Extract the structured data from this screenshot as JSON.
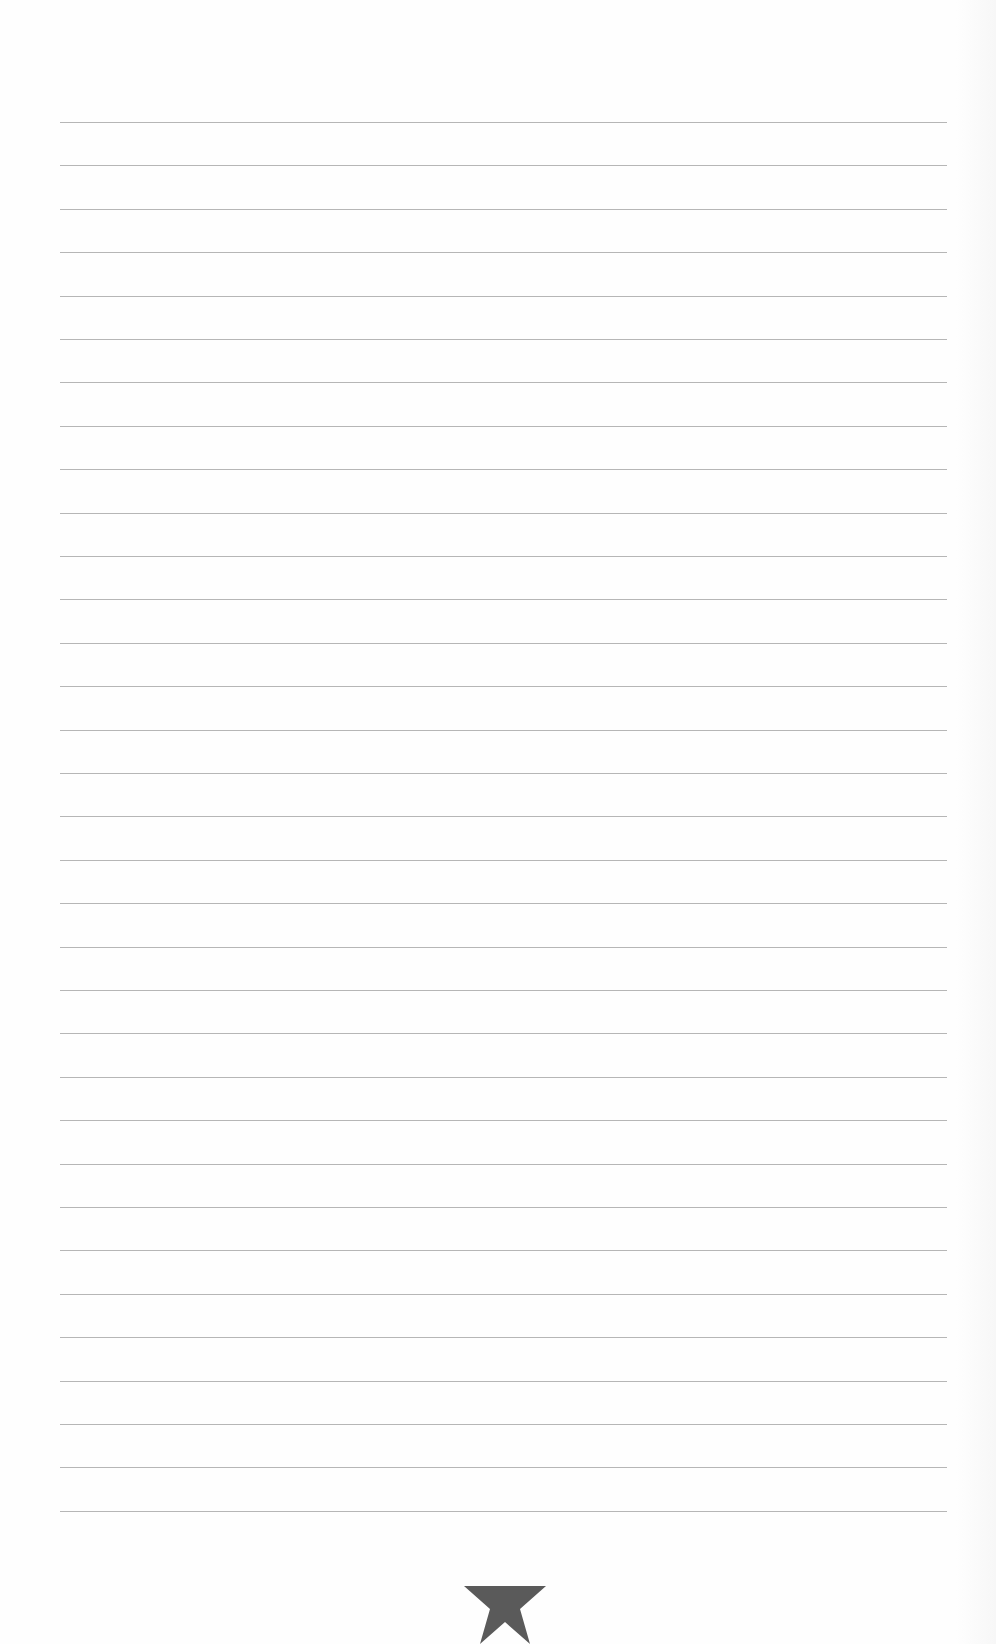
{
  "notepad": {
    "line_count": 33,
    "first_line_y": 122,
    "line_spacing": 43.4,
    "line_left": 60,
    "line_width": 887,
    "line_color": "#a9a9a9",
    "paper_color": "#fefefe"
  },
  "footer": {
    "icon": "star-icon",
    "icon_color": "#5a5a5a"
  }
}
